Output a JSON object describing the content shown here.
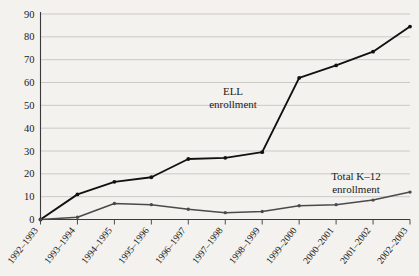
{
  "chart_data": {
    "type": "line",
    "title": "",
    "xlabel": "",
    "ylabel": "Percent",
    "ylim": [
      0,
      90
    ],
    "ytick_step": 10,
    "grid": true,
    "legend_position": "inline-annotation",
    "categories": [
      "1992–1993",
      "1993–1994",
      "1994–1995",
      "1995–1996",
      "1996–1997",
      "1997–1998",
      "1998–1999",
      "1999–2000",
      "2000–2001",
      "2001–2002",
      "2002–2003"
    ],
    "yticks": [
      0,
      10,
      20,
      30,
      40,
      50,
      60,
      70,
      80,
      90
    ],
    "series": [
      {
        "name": "ELL enrollment",
        "color": "#111111",
        "values": [
          0,
          11,
          16.5,
          18.5,
          26.5,
          27,
          29.5,
          62,
          67.5,
          73.5,
          84.5
        ]
      },
      {
        "name": "Total K–12 enrollment",
        "color": "#4a4a4a",
        "values": [
          0,
          1,
          7,
          6.5,
          4.5,
          3,
          3.5,
          6,
          6.5,
          8.5,
          12
        ]
      }
    ],
    "annotations": [
      {
        "text_line1": "ELL",
        "text_line2": "enrollment",
        "for_series": "ELL enrollment"
      },
      {
        "text_line1": "Total K–12",
        "text_line2": "enrollment",
        "for_series": "Total K–12 enrollment"
      }
    ]
  },
  "axis": {
    "y_label": "Percent"
  }
}
